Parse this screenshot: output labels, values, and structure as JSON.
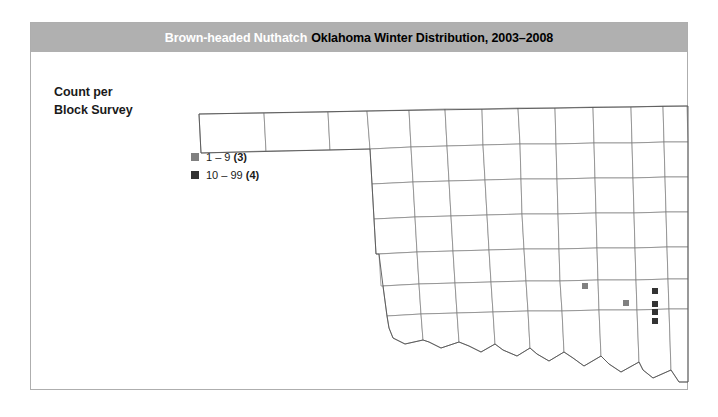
{
  "figure": {
    "title": {
      "species": "Brown-headed Nuthatch",
      "rest": "Oklahoma Winter Distribution, 2003–2008"
    },
    "banner_color": "#b0b0b0"
  },
  "legend": {
    "heading_line1": "Count per",
    "heading_line2": "Block Survey",
    "entries": [
      {
        "label": "1 – 9",
        "count": "(3)",
        "color": "#808080",
        "class": "low"
      },
      {
        "label": "10 – 99",
        "count": "(4)",
        "color": "#333333",
        "class": "high"
      }
    ]
  },
  "map": {
    "region": "Oklahoma",
    "county_outline_color": "#7d7d7d",
    "state_outline_color": "#555555",
    "panhandle_county_count": 3,
    "markers": [
      {
        "x": 584,
        "y": 285,
        "class": "low",
        "color": "#808080",
        "size": 6
      },
      {
        "x": 625,
        "y": 302,
        "class": "low",
        "color": "#808080",
        "size": 6
      },
      {
        "x": 654,
        "y": 290,
        "class": "high",
        "color": "#333333",
        "size": 6
      },
      {
        "x": 654,
        "y": 303,
        "class": "high",
        "color": "#333333",
        "size": 6
      },
      {
        "x": 654,
        "y": 311,
        "class": "high",
        "color": "#333333",
        "size": 6
      },
      {
        "x": 654,
        "y": 320,
        "class": "high",
        "color": "#333333",
        "size": 6
      }
    ]
  },
  "chart_data": {
    "type": "map",
    "ylabel": "",
    "xlabel": "",
    "legend_title": "Count per Block Survey",
    "categories": [
      "1 – 9",
      "10 – 99"
    ],
    "values": [
      3,
      4
    ],
    "colors": [
      "#808080",
      "#333333"
    ],
    "legend_position": "left",
    "grid": false
  }
}
